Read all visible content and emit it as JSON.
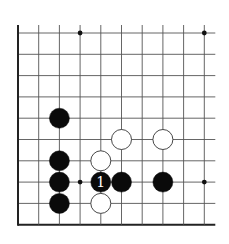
{
  "diagram": {
    "type": "go-board-partial",
    "grid": {
      "cols": 10,
      "rows": 10,
      "origin_x": 18,
      "origin_y": 33,
      "spacing_x": 20.7,
      "spacing_y": 21.3,
      "right_extension": 11,
      "left_edge": true,
      "bottom_edge": true,
      "line_color": "#555555",
      "edge_color": "#222222"
    },
    "star_points": [
      {
        "col": 3,
        "row": 0
      },
      {
        "col": 9,
        "row": 0
      },
      {
        "col": 3,
        "row": 7
      },
      {
        "col": 9,
        "row": 7
      }
    ],
    "stones": [
      {
        "color": "black",
        "col": 2,
        "row": 4,
        "label": ""
      },
      {
        "color": "black",
        "col": 2,
        "row": 6,
        "label": ""
      },
      {
        "color": "black",
        "col": 2,
        "row": 7,
        "label": ""
      },
      {
        "color": "black",
        "col": 2,
        "row": 8,
        "label": ""
      },
      {
        "color": "black",
        "col": 4,
        "row": 7,
        "label": "1"
      },
      {
        "color": "black",
        "col": 5,
        "row": 7,
        "label": ""
      },
      {
        "color": "black",
        "col": 7,
        "row": 7,
        "label": ""
      },
      {
        "color": "white",
        "col": 5,
        "row": 5,
        "label": ""
      },
      {
        "color": "white",
        "col": 7,
        "row": 5,
        "label": ""
      },
      {
        "color": "white",
        "col": 4,
        "row": 6,
        "label": ""
      },
      {
        "color": "white",
        "col": 4,
        "row": 8,
        "label": ""
      }
    ],
    "colors": {
      "black_stone": "#0a0a0a",
      "white_stone": "#ffffff",
      "white_stone_outline": "#333333",
      "label_on_black": "#ffffff"
    }
  }
}
